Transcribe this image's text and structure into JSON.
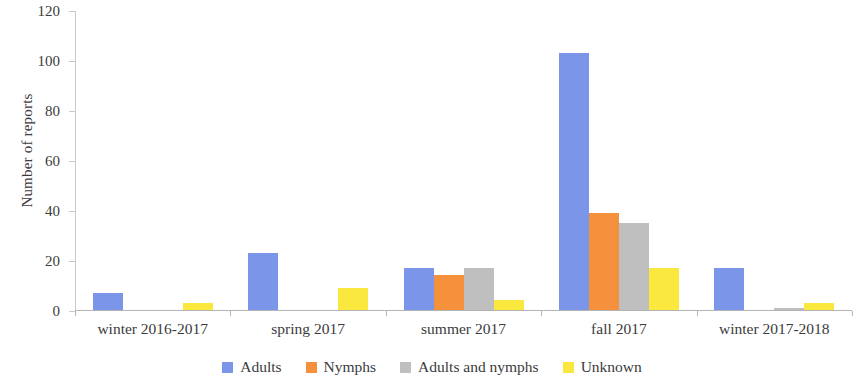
{
  "chart_data": {
    "type": "bar",
    "title": "",
    "subtitle": "",
    "xlabel": "",
    "ylabel": "Number of reports",
    "ylim": [
      0,
      120
    ],
    "ytick_step": 20,
    "yticks": [
      0,
      20,
      40,
      60,
      80,
      100,
      120
    ],
    "grid": false,
    "legend_position": "bottom",
    "categories": [
      "winter 2016-2017",
      "spring 2017",
      "summer 2017",
      "fall 2017",
      "winter 2017-2018"
    ],
    "series": [
      {
        "name": "Adults",
        "color": "#7B96E8",
        "values": [
          7,
          23,
          17,
          103,
          17
        ]
      },
      {
        "name": "Nymphs",
        "color": "#F5903C",
        "values": [
          0,
          0,
          14,
          39,
          0
        ]
      },
      {
        "name": "Adults and nymphs",
        "color": "#BFBFBF",
        "values": [
          0,
          0,
          17,
          35,
          1
        ]
      },
      {
        "name": "Unknown",
        "color": "#FBE83E",
        "values": [
          3,
          9,
          4,
          17,
          3
        ]
      }
    ]
  },
  "axis": {
    "tick_labels": [
      "120",
      "100",
      "80",
      "60",
      "40",
      "20",
      "0"
    ]
  },
  "colors": {
    "adults": "#7B96E8",
    "nymphs": "#F5903C",
    "adults_and_nymphs": "#BFBFBF",
    "unknown": "#FBE83E",
    "axis_line": "#b4b4b4",
    "text": "#3b3b3b"
  }
}
